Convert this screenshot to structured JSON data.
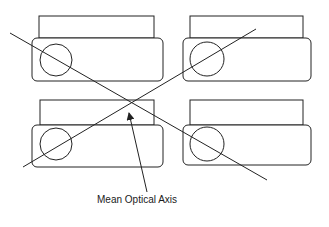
{
  "diagram": {
    "type": "optical-alignment",
    "units": [
      {
        "id": "top-left",
        "back": {
          "x": 39,
          "y": 16,
          "w": 115,
          "h": 22
        },
        "front": {
          "x": 32,
          "y": 38,
          "w": 131,
          "h": 43
        },
        "lens": {
          "cx": 56,
          "cy": 60,
          "r": 16
        }
      },
      {
        "id": "top-right",
        "back": {
          "x": 190,
          "y": 16,
          "w": 113,
          "h": 22
        },
        "front": {
          "x": 183,
          "y": 38,
          "w": 128,
          "h": 43
        },
        "lens": {
          "cx": 207,
          "cy": 59,
          "r": 17
        }
      },
      {
        "id": "bottom-left",
        "back": {
          "x": 40,
          "y": 100,
          "w": 114,
          "h": 25
        },
        "front": {
          "x": 32,
          "y": 125,
          "w": 131,
          "h": 42
        },
        "lens": {
          "cx": 56,
          "cy": 144,
          "r": 16
        }
      },
      {
        "id": "bottom-right",
        "back": {
          "x": 190,
          "y": 100,
          "w": 113,
          "h": 25
        },
        "front": {
          "x": 183,
          "y": 125,
          "w": 128,
          "h": 40
        },
        "lens": {
          "cx": 207,
          "cy": 144,
          "r": 17
        }
      }
    ],
    "axes": [
      {
        "id": "axis-diagonal-down",
        "x1": 10,
        "y1": 33,
        "x2": 267,
        "y2": 180
      },
      {
        "id": "axis-diagonal-up",
        "x1": 23,
        "y1": 167,
        "x2": 256,
        "y2": 29
      }
    ],
    "arrow": {
      "x1": 147,
      "y1": 192,
      "x2": 129,
      "y2": 113
    },
    "annotation": {
      "text": "Mean Optical Axis",
      "x": 97,
      "y": 194
    },
    "stroke_color": "#222222"
  }
}
